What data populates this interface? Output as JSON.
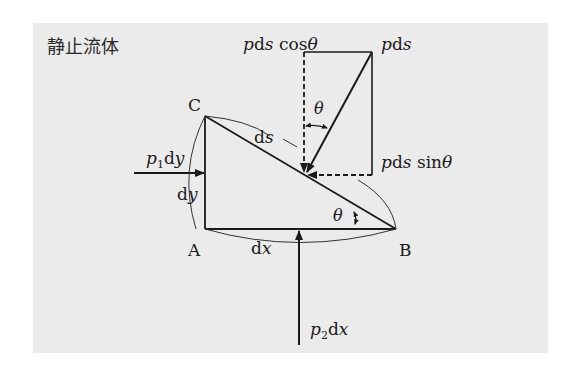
{
  "title": "静止流体",
  "points": {
    "A": {
      "label": "A",
      "x": 205,
      "y": 229
    },
    "B": {
      "label": "B",
      "x": 396,
      "y": 229
    },
    "C": {
      "label": "C",
      "x": 205,
      "y": 116
    }
  },
  "edge_labels": {
    "ds": {
      "roman": "d",
      "italic": "s"
    },
    "dy": {
      "roman": "d",
      "italic": "y"
    },
    "dx": {
      "roman": "d",
      "italic": "x"
    }
  },
  "forces": {
    "left": {
      "p": "p",
      "sub": "1",
      "d": "d",
      "var": "y"
    },
    "bottom": {
      "p": "p",
      "sub": "2",
      "d": "d",
      "var": "x"
    },
    "normal": {
      "p": "p",
      "d": "d",
      "var": "s"
    },
    "vertical_component": {
      "p": "p",
      "d": "d",
      "var": "s",
      "fn": " cos",
      "angle": "θ"
    },
    "horizontal_component": {
      "p": "p",
      "d": "d",
      "var": "s",
      "fn": " sin",
      "angle": "θ"
    }
  },
  "angles": {
    "at_B": "θ",
    "at_force": "θ"
  },
  "colors": {
    "background": "#ebebeb",
    "ink": "#1a1a1a"
  }
}
